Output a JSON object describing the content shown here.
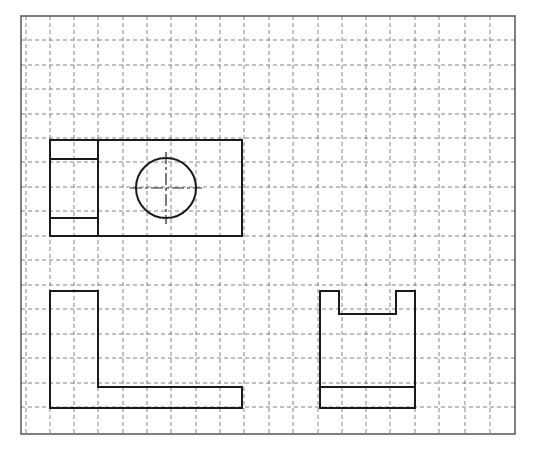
{
  "drawing": {
    "title": "Three-view orthographic drawing on grid paper",
    "colors": {
      "background": "#ffffff",
      "border": "#555555",
      "grid": "#666666",
      "outline": "#1a1a1a",
      "centerline": "#222222"
    },
    "frame": {
      "x": 21,
      "y": 16,
      "width": 494,
      "height": 418
    },
    "grid": {
      "x_lines": [
        26,
        50,
        74,
        98,
        123,
        147,
        171,
        196,
        220,
        244,
        269,
        293,
        318,
        342,
        366,
        390,
        415,
        439,
        465,
        490
      ],
      "y_lines": [
        40,
        65,
        89,
        114,
        138,
        162,
        187,
        211,
        236,
        260,
        285,
        309,
        334,
        358,
        383,
        407
      ],
      "dash": "4,3"
    },
    "views": {
      "top_view": {
        "label": "Top view",
        "outer_rect": {
          "x": 50,
          "y": 140,
          "width": 192,
          "height": 96
        },
        "divider_x": 98,
        "inner_lines_y": [
          159,
          218
        ],
        "hole": {
          "cx": 166,
          "cy": 188,
          "r": 30
        },
        "centerline_extension": 6
      },
      "front_view": {
        "label": "Front view",
        "points": "50,291 98,291 98,387 242,387 242,408 50,408"
      },
      "side_view": {
        "label": "Side view",
        "points": "320,291 339,291 339,314 396,314 396,291 415,291 415,408 320,408",
        "base_line": {
          "x1": 320,
          "y1": 387,
          "x2": 415,
          "y2": 387
        }
      }
    }
  }
}
